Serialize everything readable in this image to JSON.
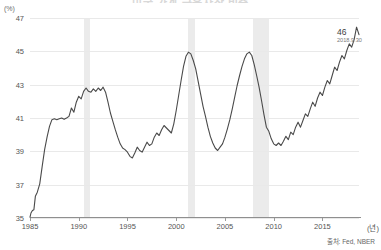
{
  "chart_data": {
    "type": "line",
    "title": "미국 가계 금융자산 비중",
    "ylabel": "(%)",
    "xlabel": "(년)",
    "ylim": [
      35,
      47
    ],
    "yticks": [
      47,
      45,
      43,
      41,
      39,
      37,
      35
    ],
    "xlim": [
      1985,
      2018.75
    ],
    "xticks": [
      1985,
      1990,
      1995,
      2000,
      2005,
      2010,
      2015
    ],
    "grid": true,
    "legend": false,
    "line_color": "#4a4a4a",
    "band_color": "#ebebeb",
    "annotation": {
      "value": "46",
      "date": "2018.9.30"
    },
    "source": "출처: Fed, NBER",
    "recession_bands": [
      {
        "start": 1990.5,
        "end": 1991.2
      },
      {
        "start": 2001.2,
        "end": 2001.9
      },
      {
        "start": 2007.9,
        "end": 2009.5
      }
    ],
    "series": [
      {
        "name": "비중",
        "x": [
          1985.0,
          1985.1,
          1985.25,
          1985.4,
          1985.55,
          1985.75,
          1986.0,
          1986.25,
          1986.5,
          1986.75,
          1987.0,
          1987.25,
          1987.5,
          1987.75,
          1988.0,
          1988.25,
          1988.5,
          1988.75,
          1989.0,
          1989.25,
          1989.5,
          1989.75,
          1990.0,
          1990.25,
          1990.5,
          1990.75,
          1991.0,
          1991.25,
          1991.5,
          1991.75,
          1992.0,
          1992.25,
          1992.5,
          1992.75,
          1993.0,
          1993.25,
          1993.5,
          1993.75,
          1994.0,
          1994.25,
          1994.5,
          1994.75,
          1995.0,
          1995.25,
          1995.5,
          1995.75,
          1996.0,
          1996.25,
          1996.5,
          1996.75,
          1997.0,
          1997.25,
          1997.5,
          1997.75,
          1998.0,
          1998.25,
          1998.5,
          1998.75,
          1999.0,
          1999.25,
          1999.5,
          1999.75,
          2000.0,
          2000.25,
          2000.5,
          2000.75,
          2001.0,
          2001.25,
          2001.5,
          2001.75,
          2002.0,
          2002.25,
          2002.5,
          2002.75,
          2003.0,
          2003.25,
          2003.5,
          2003.75,
          2004.0,
          2004.25,
          2004.5,
          2004.75,
          2005.0,
          2005.25,
          2005.5,
          2005.75,
          2006.0,
          2006.25,
          2006.5,
          2006.75,
          2007.0,
          2007.25,
          2007.5,
          2007.75,
          2008.0,
          2008.25,
          2008.5,
          2008.75,
          2009.0,
          2009.25,
          2009.5,
          2009.75,
          2010.0,
          2010.25,
          2010.5,
          2010.75,
          2011.0,
          2011.25,
          2011.5,
          2011.75,
          2012.0,
          2012.25,
          2012.5,
          2012.75,
          2013.0,
          2013.25,
          2013.5,
          2013.75,
          2014.0,
          2014.25,
          2014.5,
          2014.75,
          2015.0,
          2015.25,
          2015.5,
          2015.75,
          2016.0,
          2016.25,
          2016.5,
          2016.75,
          2017.0,
          2017.25,
          2017.5,
          2017.75,
          2018.0,
          2018.25,
          2018.5,
          2018.75
        ],
        "y": [
          35.05,
          35.3,
          35.45,
          35.5,
          36.3,
          36.55,
          37.05,
          38.1,
          39.1,
          39.85,
          40.5,
          40.9,
          40.95,
          40.9,
          40.95,
          41.0,
          40.92,
          41.0,
          41.1,
          41.6,
          41.35,
          41.95,
          42.3,
          42.15,
          42.6,
          42.8,
          42.6,
          42.55,
          42.75,
          42.6,
          42.8,
          42.65,
          42.85,
          42.55,
          41.95,
          41.3,
          40.8,
          40.3,
          39.85,
          39.45,
          39.2,
          39.1,
          38.95,
          38.7,
          38.6,
          38.9,
          39.25,
          39.05,
          38.95,
          39.25,
          39.55,
          39.35,
          39.45,
          39.85,
          40.1,
          39.95,
          40.3,
          40.55,
          40.4,
          40.25,
          40.1,
          40.65,
          41.45,
          42.35,
          43.25,
          44.1,
          44.7,
          44.95,
          44.85,
          44.45,
          43.95,
          43.2,
          42.45,
          41.7,
          41.1,
          40.45,
          39.9,
          39.5,
          39.2,
          39.05,
          39.25,
          39.45,
          39.85,
          40.35,
          40.9,
          41.55,
          42.25,
          42.95,
          43.55,
          44.1,
          44.55,
          44.85,
          44.95,
          44.75,
          44.2,
          43.55,
          42.85,
          42.05,
          41.2,
          40.45,
          40.2,
          39.75,
          39.45,
          39.35,
          39.5,
          39.35,
          39.6,
          39.9,
          39.7,
          40.15,
          40.0,
          40.45,
          40.75,
          40.45,
          40.85,
          41.25,
          41.1,
          41.55,
          41.95,
          41.7,
          42.2,
          42.55,
          42.35,
          42.85,
          43.25,
          43.05,
          43.55,
          44.05,
          43.85,
          44.35,
          44.75,
          44.55,
          45.05,
          45.45,
          45.25,
          45.7,
          46.45,
          46.0
        ]
      }
    ]
  }
}
